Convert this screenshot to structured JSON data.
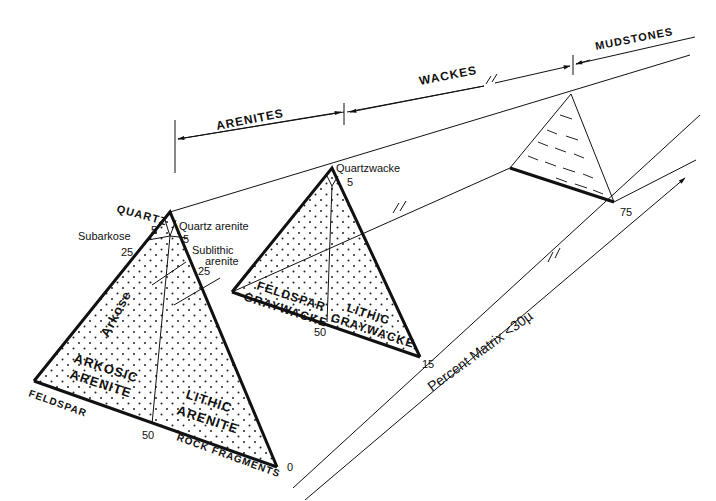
{
  "diagram": {
    "groups": {
      "arenites": "ARENITES",
      "wackes": "WACKES",
      "mudstones": "MUDSTONES"
    },
    "axis": {
      "label": "Percent Matrix <30µ",
      "ticks": [
        "0",
        "15",
        "75"
      ]
    },
    "arenite_triangle": {
      "apices": {
        "top": "QUARTZ",
        "left": "FELDSPAR",
        "right": "ROCK FRAGMENTS"
      },
      "ticks": {
        "left5": "5",
        "left25": "25",
        "right5": "5",
        "right25": "25",
        "base50": "50"
      },
      "fields": {
        "quartz_arenite": "Quartz arenite",
        "subarkose": "Subarkose",
        "sublithic_1": "Sublithic",
        "sublithic_2": "arenite",
        "arkose": "Arkose",
        "arkosic_1": "ARKOSIC",
        "arkosic_2": "ARENITE",
        "lithic_1": "LITHIC",
        "lithic_2": "ARENITE"
      }
    },
    "wacke_triangle": {
      "ticks": {
        "top5": "5",
        "base50": "50"
      },
      "fields": {
        "quartzwacke": "Quartzwacke",
        "feldspar_1": "FELDSPAR",
        "feldspar_2": "GRAYWACKE",
        "lithic_1": "LITHIC",
        "lithic_2": "GRAYWACKE"
      }
    },
    "mudstone_triangle": {
      "pattern": "dashed"
    }
  }
}
